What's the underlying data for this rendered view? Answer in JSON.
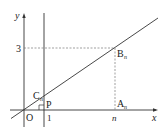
{
  "diagram": {
    "axes": {
      "x_label": "x",
      "y_label": "y",
      "origin_label": "O"
    },
    "ticks": {
      "x_one": "1",
      "x_n": "n",
      "y_three": "3"
    },
    "points": {
      "P": "P",
      "C_main": "C",
      "C_sub": "n",
      "B_main": "B",
      "B_sub": "n",
      "A_main": "A",
      "A_sub": "n"
    },
    "lines": {
      "main_line": "line through origin region crossing x=1 at C_n and reaching B_n(n,3)",
      "vertical_line": "x = 1",
      "dashed_horizontal": "y = 3",
      "dashed_vertical": "x = n"
    },
    "colors": {
      "stroke": "#333333",
      "dashed": "#777777",
      "background": "#ffffff"
    }
  }
}
